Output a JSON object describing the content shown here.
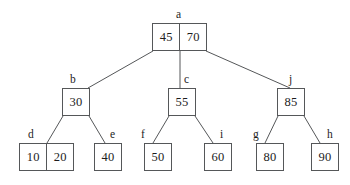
{
  "diagram": {
    "type": "b-tree",
    "stroke_color": "#555759",
    "text_color": "#1c1c1c",
    "background_color": "#ffffff",
    "nodes": [
      {
        "id": "a",
        "label": "a",
        "keys": [
          "45",
          "70"
        ],
        "level": 0,
        "box": {
          "x": 152,
          "y": 23,
          "w": 55,
          "h": 28
        },
        "label_pos": {
          "x": 176,
          "y": 9
        },
        "children": [
          "b",
          "c",
          "j"
        ]
      },
      {
        "id": "b",
        "label": "b",
        "keys": [
          "30"
        ],
        "level": 1,
        "box": {
          "x": 62,
          "y": 88,
          "w": 28,
          "h": 28
        },
        "label_pos": {
          "x": 70,
          "y": 74
        },
        "children": [
          "d",
          "e"
        ]
      },
      {
        "id": "c",
        "label": "c",
        "keys": [
          "55"
        ],
        "level": 1,
        "box": {
          "x": 168,
          "y": 88,
          "w": 28,
          "h": 28
        },
        "label_pos": {
          "x": 184,
          "y": 74
        },
        "children": [
          "f",
          "i"
        ]
      },
      {
        "id": "j",
        "label": "j",
        "keys": [
          "85"
        ],
        "level": 1,
        "box": {
          "x": 277,
          "y": 88,
          "w": 28,
          "h": 28
        },
        "label_pos": {
          "x": 289,
          "y": 74
        },
        "children": [
          "g",
          "h"
        ]
      },
      {
        "id": "d",
        "label": "d",
        "keys": [
          "10",
          "20"
        ],
        "level": 2,
        "box": {
          "x": 19,
          "y": 143,
          "w": 55,
          "h": 28
        },
        "label_pos": {
          "x": 28,
          "y": 129
        },
        "children": []
      },
      {
        "id": "e",
        "label": "e",
        "keys": [
          "40"
        ],
        "level": 2,
        "box": {
          "x": 94,
          "y": 143,
          "w": 28,
          "h": 28
        },
        "label_pos": {
          "x": 110,
          "y": 129
        },
        "children": []
      },
      {
        "id": "f",
        "label": "f",
        "keys": [
          "50"
        ],
        "level": 2,
        "box": {
          "x": 144,
          "y": 143,
          "w": 28,
          "h": 28
        },
        "label_pos": {
          "x": 141,
          "y": 129
        },
        "children": []
      },
      {
        "id": "i",
        "label": "i",
        "keys": [
          "60"
        ],
        "level": 2,
        "box": {
          "x": 204,
          "y": 143,
          "w": 28,
          "h": 28
        },
        "label_pos": {
          "x": 220,
          "y": 129
        },
        "children": []
      },
      {
        "id": "g",
        "label": "g",
        "keys": [
          "80"
        ],
        "level": 2,
        "box": {
          "x": 256,
          "y": 143,
          "w": 28,
          "h": 28
        },
        "label_pos": {
          "x": 253,
          "y": 129
        },
        "children": []
      },
      {
        "id": "h",
        "label": "h",
        "keys": [
          "90"
        ],
        "level": 2,
        "box": {
          "x": 311,
          "y": 143,
          "w": 28,
          "h": 28
        },
        "label_pos": {
          "x": 327,
          "y": 129
        },
        "children": []
      }
    ],
    "edges": [
      {
        "from": "a",
        "to": "b",
        "x1": 153,
        "y1": 51,
        "x2": 88,
        "y2": 88
      },
      {
        "from": "a",
        "to": "c",
        "x1": 180,
        "y1": 51,
        "x2": 180,
        "y2": 88
      },
      {
        "from": "a",
        "to": "j",
        "x1": 206,
        "y1": 51,
        "x2": 290,
        "y2": 88
      },
      {
        "from": "b",
        "to": "d",
        "x1": 63,
        "y1": 116,
        "x2": 47,
        "y2": 143
      },
      {
        "from": "b",
        "to": "e",
        "x1": 89,
        "y1": 116,
        "x2": 105,
        "y2": 143
      },
      {
        "from": "c",
        "to": "f",
        "x1": 169,
        "y1": 116,
        "x2": 153,
        "y2": 143
      },
      {
        "from": "c",
        "to": "i",
        "x1": 195,
        "y1": 116,
        "x2": 213,
        "y2": 143
      },
      {
        "from": "j",
        "to": "g",
        "x1": 278,
        "y1": 116,
        "x2": 265,
        "y2": 143
      },
      {
        "from": "j",
        "to": "h",
        "x1": 304,
        "y1": 116,
        "x2": 320,
        "y2": 143
      }
    ]
  }
}
